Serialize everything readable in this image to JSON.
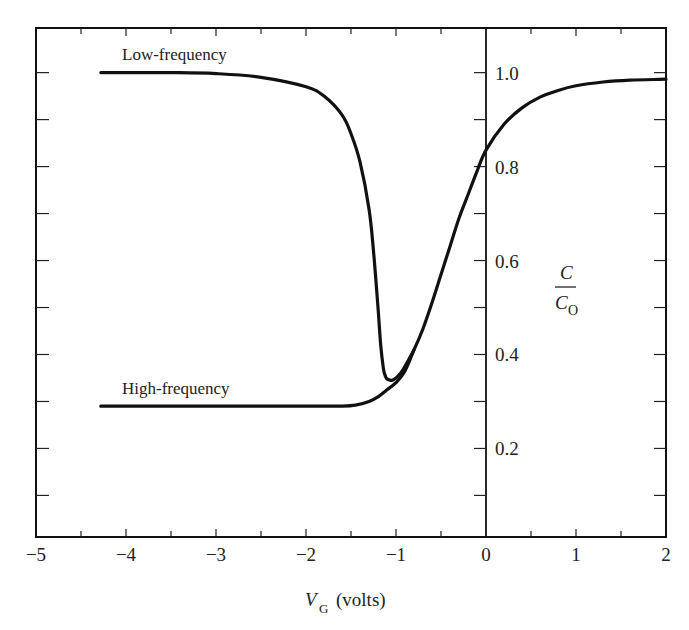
{
  "chart_data": {
    "type": "line",
    "title": "",
    "xlabel": "V_G (volts)",
    "xlabel_main": "V",
    "xlabel_sub": "G",
    "xlabel_rest": "(volts)",
    "ylabel": "C / C_O",
    "ylabel_num": "C",
    "ylabel_den": "C",
    "ylabel_den_sub": "O",
    "xlim": [
      -5,
      2
    ],
    "ylim": [
      0.0115,
      1.095
    ],
    "x_ticks": [
      -5,
      -4,
      -3,
      -2,
      -1,
      0,
      1,
      2
    ],
    "x_tick_labels": [
      "−5",
      "−4",
      "−3",
      "−2",
      "−1",
      "0",
      "1",
      "2"
    ],
    "y_ticks": [
      0.2,
      0.4,
      0.6,
      0.8,
      1.0
    ],
    "y_tick_labels": [
      "0.2",
      "0.4",
      "0.6",
      "0.8",
      "1.0"
    ],
    "grid": false,
    "legend": "none",
    "series": [
      {
        "name": "Low-frequency",
        "label": "Low-frequency",
        "x": [
          -4.28,
          -3.5,
          -3.0,
          -2.5,
          -2.0,
          -1.8,
          -1.6,
          -1.5,
          -1.4,
          -1.3,
          -1.25,
          -1.2,
          -1.17,
          -1.14,
          -1.12,
          -1.1,
          -1.05,
          -1.0,
          -0.95,
          -0.9,
          -0.8,
          -0.7,
          -0.6,
          -0.5,
          -0.4,
          -0.3,
          -0.2,
          -0.1,
          0.0,
          0.2,
          0.4,
          0.6,
          0.8,
          1.0,
          1.3,
          1.6,
          2.0
        ],
        "y": [
          1.0,
          1.0,
          0.998,
          0.99,
          0.97,
          0.95,
          0.91,
          0.87,
          0.81,
          0.71,
          0.62,
          0.5,
          0.42,
          0.37,
          0.355,
          0.348,
          0.345,
          0.35,
          0.36,
          0.375,
          0.41,
          0.455,
          0.51,
          0.57,
          0.63,
          0.69,
          0.74,
          0.79,
          0.835,
          0.89,
          0.925,
          0.948,
          0.962,
          0.972,
          0.98,
          0.984,
          0.986
        ]
      },
      {
        "name": "High-frequency",
        "label": "High-frequency",
        "x": [
          -4.28,
          -3.0,
          -2.0,
          -1.6,
          -1.45,
          -1.3,
          -1.2,
          -1.1,
          -1.0,
          -0.9,
          -0.8
        ],
        "y": [
          0.29,
          0.29,
          0.29,
          0.29,
          0.292,
          0.3,
          0.31,
          0.325,
          0.34,
          0.365,
          0.41
        ]
      }
    ],
    "vertical_axis_at_x": 0
  }
}
